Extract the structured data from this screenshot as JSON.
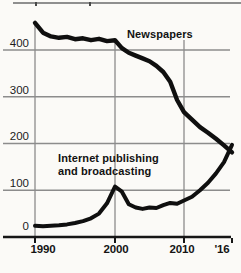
{
  "colors": {
    "background": "#fbfaf7",
    "grid": "#8c8c8c",
    "axis": "#161616",
    "line": "#0f0f0f",
    "text": "#141414"
  },
  "chart_data": {
    "type": "line",
    "title": "",
    "xlabel": "",
    "ylabel": "",
    "x": [
      1990,
      1991,
      1992,
      1993,
      1994,
      1995,
      1996,
      1997,
      1998,
      1999,
      2000,
      2001,
      2002,
      2003,
      2004,
      2005,
      2006,
      2007,
      2008,
      2009,
      2010,
      2011,
      2012,
      2013,
      2014,
      2015,
      2016
    ],
    "series": [
      {
        "name": "Newspapers",
        "values": [
          458,
          437,
          429,
          426,
          428,
          423,
          425,
          421,
          424,
          419,
          421,
          404,
          394,
          388,
          382,
          376,
          366,
          353,
          332,
          293,
          267,
          251,
          235,
          223,
          210,
          196,
          181
        ]
      },
      {
        "name": "Internet publishing and broadcasting",
        "values": [
          24,
          23,
          24,
          25,
          27,
          30,
          34,
          40,
          50,
          72,
          108,
          97,
          70,
          63,
          60,
          63,
          62,
          68,
          73,
          71,
          78,
          86,
          100,
          116,
          136,
          160,
          197
        ]
      }
    ],
    "ylim": [
      0,
      470
    ],
    "yticks": [
      400,
      300,
      200,
      100
    ],
    "ytick_labels": [
      "400",
      "300",
      "200",
      "100",
      "0"
    ],
    "xtick_years": [
      1990,
      2000,
      2010,
      2016
    ],
    "xtick_labels": [
      "1990",
      "2000",
      "2010",
      "'16"
    ],
    "grid": "on",
    "legend_position": "inline annotations"
  }
}
